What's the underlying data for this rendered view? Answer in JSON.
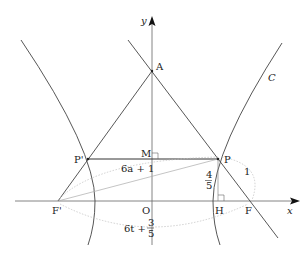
{
  "diagram": {
    "axes": {
      "x_label": "x",
      "y_label": "y",
      "origin_label": "O"
    },
    "curve_label": "C",
    "points": {
      "A": "A",
      "P": "P",
      "P_prime": "P'",
      "M": "M",
      "F": "F",
      "F_prime": "F'",
      "H": "H"
    },
    "annotations": {
      "PF_length": "1",
      "PH_num": "4",
      "PH_den": "5",
      "FP_prime_label": "6a + 1",
      "FprimeF_label_main": "6t +",
      "FprimeF_num": "3",
      "FprimeF_den": "5"
    },
    "colors": {
      "line": "#444444",
      "axis": "#555555",
      "dotted": "#aaaaaa",
      "text": "#222222"
    }
  }
}
